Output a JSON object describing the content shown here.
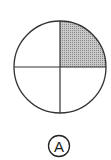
{
  "figure": {
    "shape": "circle",
    "divisions": 4,
    "shaded_quadrant": "top-right",
    "shaded_fraction": "1/4",
    "fill_color": "#b8b8b8",
    "stroke_color": "#333333"
  },
  "label": {
    "text": "A",
    "style": "circled"
  }
}
